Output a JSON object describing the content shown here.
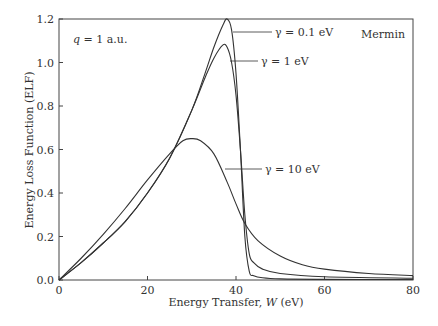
{
  "chart_data": {
    "type": "line",
    "title": "",
    "xlabel": "Energy Transfer, W (eV)",
    "ylabel": "Energy Loss Function (ELF)",
    "xlim": [
      0,
      80
    ],
    "ylim": [
      0,
      1.2
    ],
    "xticks": [
      "0",
      "20",
      "40",
      "60",
      "80"
    ],
    "yticks": [
      "0.0",
      "0.2",
      "0.4",
      "0.6",
      "0.8",
      "1.0",
      "1.2"
    ],
    "grid": false,
    "annotations": [
      "q = 1 a.u.",
      "Mermin"
    ],
    "series": [
      {
        "name": "γ = 0.1 eV",
        "x": [
          0,
          5,
          10,
          15,
          20,
          25,
          30,
          33,
          35,
          37,
          38,
          39,
          40,
          41,
          42,
          43,
          44,
          46,
          50,
          60,
          80
        ],
        "y": [
          0,
          0.08,
          0.17,
          0.27,
          0.4,
          0.56,
          0.78,
          0.95,
          1.07,
          1.17,
          1.2,
          1.15,
          0.95,
          0.6,
          0.2,
          0.04,
          0.02,
          0.01,
          0.005,
          0.003,
          0.002
        ]
      },
      {
        "name": "γ = 1 eV",
        "x": [
          0,
          5,
          10,
          15,
          20,
          25,
          30,
          33,
          35,
          37,
          38,
          39,
          40,
          41,
          42,
          43,
          44,
          46,
          50,
          60,
          80
        ],
        "y": [
          0,
          0.08,
          0.17,
          0.27,
          0.4,
          0.56,
          0.78,
          0.93,
          1.02,
          1.08,
          1.07,
          1.0,
          0.85,
          0.6,
          0.3,
          0.12,
          0.08,
          0.05,
          0.03,
          0.015,
          0.008
        ]
      },
      {
        "name": "γ = 10 eV",
        "x": [
          0,
          5,
          10,
          15,
          20,
          25,
          28,
          30,
          32,
          35,
          38,
          40,
          42,
          45,
          50,
          55,
          60,
          70,
          80
        ],
        "y": [
          0,
          0.1,
          0.21,
          0.33,
          0.46,
          0.58,
          0.64,
          0.65,
          0.64,
          0.58,
          0.45,
          0.35,
          0.26,
          0.18,
          0.11,
          0.07,
          0.05,
          0.03,
          0.02
        ]
      }
    ]
  },
  "labels": {
    "q": "q = 1 a.u.",
    "model": "Mermin",
    "xlabel_pre": "Energy Transfer, ",
    "xlabel_var": "W",
    "xlabel_unit": " (eV)",
    "ylabel": "Energy Loss Function (ELF)",
    "g01": "γ = 0.1 eV",
    "g1": "γ = 1 eV",
    "g10": "γ = 10 eV"
  }
}
